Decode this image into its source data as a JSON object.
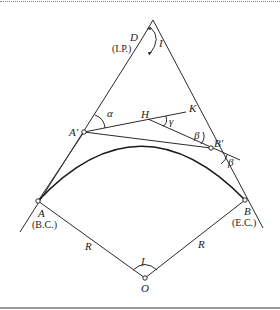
{
  "diagram": {
    "points": {
      "D": {
        "label": "D",
        "sublabel": "(I.P.)",
        "x": 140,
        "y": 42
      },
      "A_prime": {
        "label": "A′",
        "x": 84,
        "y": 132
      },
      "B_prime": {
        "label": "B′",
        "x": 211,
        "y": 148
      },
      "H": {
        "label": "H",
        "x": 148,
        "y": 118
      },
      "K": {
        "label": "K",
        "x": 186,
        "y": 112
      },
      "A": {
        "label": "A",
        "sublabel": "(B.C.)",
        "x": 38,
        "y": 201
      },
      "B": {
        "label": "B",
        "sublabel": "(E.C.)",
        "x": 245,
        "y": 200
      },
      "O": {
        "label": "O",
        "x": 145,
        "y": 278
      }
    },
    "angles": {
      "I_top": "I",
      "alpha": "α",
      "gamma": "γ",
      "beta_upper": "β",
      "beta_lower": "β",
      "I_center": "I"
    },
    "radii": {
      "left": "R",
      "right": "R"
    }
  }
}
